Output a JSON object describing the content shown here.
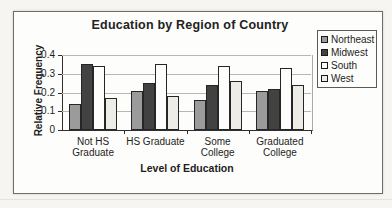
{
  "chart_data": {
    "type": "bar",
    "title": "Education by Region of Country",
    "xlabel": "Level of Education",
    "ylabel": "Relative Frequency",
    "categories": [
      "Not HS Graduate",
      "HS Graduate",
      "Some College",
      "Graduated College"
    ],
    "category_label_lines": [
      [
        "Not HS",
        "Graduate"
      ],
      [
        "HS Graduate"
      ],
      [
        "Some",
        "College"
      ],
      [
        "Graduated",
        "College"
      ]
    ],
    "series": [
      {
        "name": "Northeast",
        "color": "#9b9b9b",
        "values": [
          0.14,
          0.21,
          0.16,
          0.21
        ]
      },
      {
        "name": "Midwest",
        "color": "#424242",
        "values": [
          0.35,
          0.25,
          0.24,
          0.22
        ]
      },
      {
        "name": "South",
        "color": "#fdfdfc",
        "values": [
          0.34,
          0.35,
          0.34,
          0.33
        ]
      },
      {
        "name": "West",
        "color": "#edece7",
        "values": [
          0.17,
          0.18,
          0.26,
          0.24
        ]
      }
    ],
    "y_ticks": [
      0,
      0.1,
      0.2,
      0.3,
      0.4
    ],
    "y_tick_labels": [
      "0",
      "0.1",
      "0.2",
      "0.3",
      "0.4"
    ],
    "ylim": [
      0,
      0.4
    ],
    "grid": true,
    "legend_position": "right",
    "colors": {
      "grid": "#b7b6b2",
      "axis": "#2f2f2f",
      "frame_border": "#6e6e6e",
      "background": "#f6f5f1",
      "plot_background": "#fdfdfb"
    }
  }
}
